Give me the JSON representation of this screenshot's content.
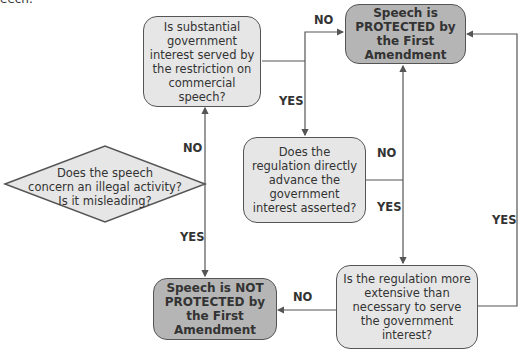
{
  "fragment": "eech.",
  "nodes": {
    "diamond": "Does the speech concern an illegal activity? Is it misleading?",
    "diamond_lines": [
      "Does the speech",
      "concern an illegal activity?",
      "Is it misleading?"
    ],
    "substantial_interest": "Is substantial government interest served by the restriction on commercial speech?",
    "protected": "Speech is PROTECTED by the First Amendment",
    "directly_advance": "Does the regulation directly advance the government interest asserted?",
    "not_protected": "Speech is NOT PROTECTED by the First Amendment",
    "more_extensive": "Is the regulation more extensive than necessary to serve the government interest?"
  },
  "edges": {
    "diamond_no": "NO",
    "diamond_yes": "YES",
    "interest_no": "NO",
    "interest_yes": "YES",
    "advance_no": "NO",
    "advance_yes": "YES",
    "extensive_no": "NO",
    "extensive_yes": "YES"
  },
  "colors": {
    "question_fill": "#e6e6e6",
    "outcome_fill": "#b5b5b5",
    "stroke": "#555555"
  }
}
